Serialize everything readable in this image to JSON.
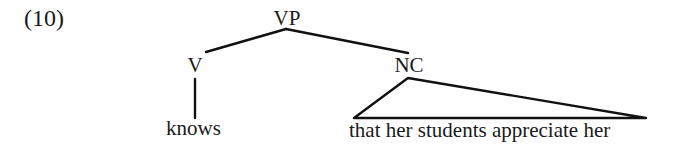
{
  "example": {
    "number": "(10)"
  },
  "tree": {
    "root": {
      "label": "VP",
      "children": [
        {
          "label": "V",
          "children": [
            {
              "label": "knows",
              "terminal": true
            }
          ]
        },
        {
          "label": "NC",
          "collapsed": true,
          "triangle_text": "that her students appreciate her"
        }
      ]
    }
  },
  "colors": {
    "ink": "#111111",
    "background": "#ffffff"
  }
}
